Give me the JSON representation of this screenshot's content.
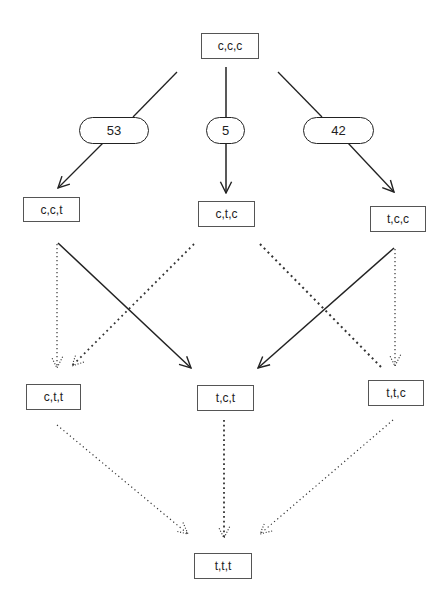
{
  "nodes": {
    "ccc": "c,c,c",
    "cct": "c,c,t",
    "ctc": "c,t,c",
    "tcc": "t,c,c",
    "ctt": "c,t,t",
    "tct": "t,c,t",
    "ttc": "t,t,c",
    "ttt": "t,t,t"
  },
  "edge_labels": {
    "ccc_to_cct": "53",
    "ccc_to_ctc": "5",
    "ccc_to_tcc": "42"
  },
  "edges": [
    {
      "from": "c,c,c",
      "to": "c,c,t",
      "style": "solid",
      "label": "53"
    },
    {
      "from": "c,c,c",
      "to": "c,t,c",
      "style": "solid",
      "label": "5"
    },
    {
      "from": "c,c,c",
      "to": "t,c,c",
      "style": "solid",
      "label": "42"
    },
    {
      "from": "c,c,t",
      "to": "c,t,t",
      "style": "dotted"
    },
    {
      "from": "c,c,t",
      "to": "t,c,t",
      "style": "solid"
    },
    {
      "from": "c,t,c",
      "to": "c,t,t",
      "style": "dotted"
    },
    {
      "from": "c,t,c",
      "to": "t,t,c",
      "style": "dotted"
    },
    {
      "from": "t,c,c",
      "to": "t,c,t",
      "style": "solid"
    },
    {
      "from": "t,c,c",
      "to": "t,t,c",
      "style": "dotted"
    },
    {
      "from": "c,t,t",
      "to": "t,t,t",
      "style": "dotted"
    },
    {
      "from": "t,c,t",
      "to": "t,t,t",
      "style": "dotted"
    },
    {
      "from": "t,t,c",
      "to": "t,t,t",
      "style": "dotted"
    }
  ]
}
